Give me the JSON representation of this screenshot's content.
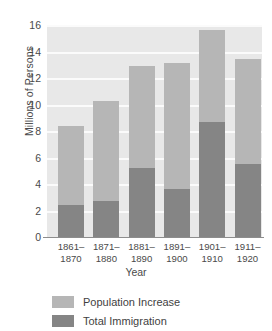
{
  "chart_data": {
    "type": "bar",
    "subtype": "stacked-vertical",
    "title": "",
    "xlabel": "Year",
    "ylabel": "Millions of Persons",
    "categories": [
      "1861-1870",
      "1871-1880",
      "1881-1890",
      "1891-1900",
      "1901-1910",
      "1911-1920"
    ],
    "category_lines": [
      [
        "1861–",
        "1870"
      ],
      [
        "1871–",
        "1880"
      ],
      [
        "1881–",
        "1890"
      ],
      [
        "1891–",
        "1900"
      ],
      [
        "1901–",
        "1910"
      ],
      [
        "1911–",
        "1920"
      ]
    ],
    "series": [
      {
        "name": "Total Immigration",
        "color": "#858585",
        "values": [
          2.4,
          2.7,
          5.2,
          3.6,
          8.7,
          5.5
        ]
      },
      {
        "name": "Population Increase",
        "color": "#b6b6b6",
        "values": [
          6.0,
          7.6,
          7.7,
          9.5,
          6.9,
          7.9
        ]
      }
    ],
    "stack_totals": [
      8.4,
      10.3,
      12.9,
      13.1,
      15.6,
      13.4
    ],
    "ylim": [
      0,
      16
    ],
    "yticks": [
      0,
      2,
      4,
      6,
      8,
      10,
      12,
      14,
      16
    ],
    "ytick_labels": [
      "0",
      "2",
      "4",
      "6",
      "8",
      "10",
      "12",
      "14",
      "16"
    ],
    "grid": true,
    "grid_axis": "y",
    "legend_position": "bottom-left",
    "plot_background": "#e8e8e8",
    "gridline_color": "#fbfbfb"
  },
  "legend": {
    "items": [
      {
        "label": "Population Increase",
        "swatch": "pop"
      },
      {
        "label": "Total Immigration",
        "swatch": "imm"
      }
    ]
  }
}
